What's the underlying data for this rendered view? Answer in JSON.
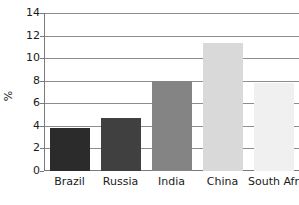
{
  "chart_data": {
    "type": "bar",
    "title": "",
    "xlabel": "",
    "ylabel": "%",
    "categories": [
      "Brazil",
      "Russia",
      "India",
      "China",
      "South Africa"
    ],
    "values": [
      3.8,
      4.7,
      8.0,
      11.3,
      7.8
    ],
    "ylim": [
      0,
      14
    ],
    "yticks": [
      0,
      2,
      4,
      6,
      8,
      10,
      12,
      14
    ],
    "ytick_labels": [
      "0",
      "2",
      "4",
      "6",
      "8",
      "10",
      "12",
      "14"
    ],
    "grid": true,
    "legend": "none",
    "bar_colors": [
      "#2b2b2b",
      "#404040",
      "#848484",
      "#d9d9d9",
      "#f0f0f0"
    ],
    "axis_color": "#7a7a7a",
    "grid_color": "#8c8c8c",
    "text_color": "#1a1a1a",
    "background": "#ffffff"
  }
}
